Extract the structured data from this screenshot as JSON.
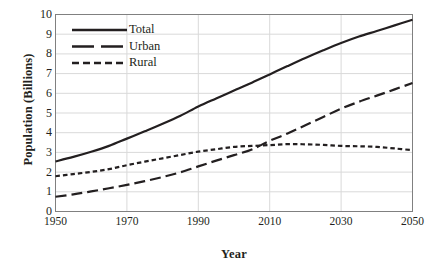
{
  "chart_data": {
    "type": "line",
    "title": "",
    "xlabel": "Year",
    "ylabel": "Population (Billions)",
    "xlim": [
      1950,
      2050
    ],
    "ylim": [
      0,
      10
    ],
    "grid": true,
    "legend_position": "top-left",
    "xticks": [
      "1950",
      "1970",
      "1990",
      "2010",
      "2030",
      "2050"
    ],
    "xtick_values": [
      1950,
      1970,
      1990,
      2010,
      2030,
      2050
    ],
    "yticks": [
      "0",
      "1",
      "2",
      "3",
      "4",
      "5",
      "6",
      "7",
      "8",
      "9",
      "10"
    ],
    "ytick_values": [
      0,
      1,
      2,
      3,
      4,
      5,
      6,
      7,
      8,
      9,
      10
    ],
    "x": [
      1950,
      1955,
      1960,
      1965,
      1970,
      1975,
      1980,
      1985,
      1990,
      1995,
      2000,
      2005,
      2010,
      2015,
      2020,
      2025,
      2030,
      2035,
      2040,
      2045,
      2050
    ],
    "series": [
      {
        "name": "Total",
        "style": "solid",
        "color": "#231f20",
        "values": [
          2.54,
          2.77,
          3.03,
          3.33,
          3.7,
          4.07,
          4.45,
          4.86,
          5.33,
          5.74,
          6.14,
          6.54,
          6.96,
          7.38,
          7.79,
          8.18,
          8.55,
          8.88,
          9.16,
          9.45,
          9.73
        ]
      },
      {
        "name": "Urban",
        "style": "long-dash",
        "color": "#231f20",
        "values": [
          0.75,
          0.87,
          1.02,
          1.18,
          1.35,
          1.54,
          1.75,
          1.99,
          2.29,
          2.58,
          2.86,
          3.15,
          3.59,
          3.96,
          4.38,
          4.8,
          5.22,
          5.57,
          5.88,
          6.2,
          6.52
        ]
      },
      {
        "name": "Rural",
        "style": "short-dash",
        "color": "#231f20",
        "values": [
          1.79,
          1.9,
          2.01,
          2.15,
          2.35,
          2.53,
          2.7,
          2.87,
          3.04,
          3.16,
          3.28,
          3.33,
          3.37,
          3.42,
          3.41,
          3.38,
          3.33,
          3.31,
          3.28,
          3.2,
          3.11
        ]
      }
    ],
    "legend": [
      {
        "label": "Total",
        "style": "solid"
      },
      {
        "label": "Urban",
        "style": "long-dash"
      },
      {
        "label": "Rural",
        "style": "short-dash"
      }
    ],
    "colors": {
      "line": "#231f20",
      "grid": "#d9d9d9",
      "axis": "#808080",
      "background": "#ffffff"
    }
  }
}
